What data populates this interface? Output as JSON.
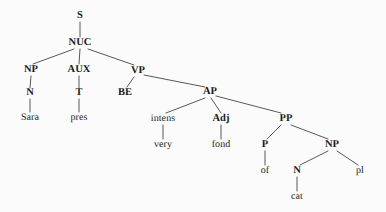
{
  "diagram": {
    "sentence": "Sara is very fond of cats",
    "background_color": "#fbfbfb",
    "line_color": "#3a3a3a",
    "text_color": "#1a1a1a"
  },
  "nodes": [
    {
      "id": "S",
      "label": "S",
      "kind": "category",
      "x": 80,
      "y": 16
    },
    {
      "id": "NUC",
      "label": "NUC",
      "kind": "category",
      "x": 80,
      "y": 43
    },
    {
      "id": "NP1",
      "label": "NP",
      "kind": "category",
      "x": 31,
      "y": 70
    },
    {
      "id": "AUX",
      "label": "AUX",
      "kind": "category",
      "x": 79,
      "y": 70
    },
    {
      "id": "VP",
      "label": "VP",
      "kind": "category",
      "x": 138,
      "y": 71
    },
    {
      "id": "N1",
      "label": "N",
      "kind": "category",
      "x": 30,
      "y": 93
    },
    {
      "id": "T",
      "label": "T",
      "kind": "category",
      "x": 79,
      "y": 93
    },
    {
      "id": "BE",
      "label": "BE",
      "kind": "category",
      "x": 125,
      "y": 93
    },
    {
      "id": "Sara",
      "label": "Sara",
      "kind": "leaf",
      "x": 30,
      "y": 118
    },
    {
      "id": "pres",
      "label": "pres",
      "kind": "leaf",
      "x": 79,
      "y": 118
    },
    {
      "id": "AP",
      "label": "AP",
      "kind": "category",
      "x": 210,
      "y": 92
    },
    {
      "id": "intens",
      "label": "intens",
      "kind": "leaf",
      "x": 163,
      "y": 119
    },
    {
      "id": "Adj",
      "label": "Adj",
      "kind": "category",
      "x": 221,
      "y": 119
    },
    {
      "id": "PP",
      "label": "PP",
      "kind": "category",
      "x": 286,
      "y": 119
    },
    {
      "id": "very",
      "label": "very",
      "kind": "leaf",
      "x": 163,
      "y": 145
    },
    {
      "id": "fond",
      "label": "fond",
      "kind": "leaf",
      "x": 221,
      "y": 145
    },
    {
      "id": "P",
      "label": "P",
      "kind": "category",
      "x": 265,
      "y": 145
    },
    {
      "id": "NP2",
      "label": "NP",
      "kind": "category",
      "x": 332,
      "y": 145
    },
    {
      "id": "of",
      "label": "of",
      "kind": "leaf",
      "x": 265,
      "y": 171
    },
    {
      "id": "N2",
      "label": "N",
      "kind": "category",
      "x": 297,
      "y": 171
    },
    {
      "id": "pl",
      "label": "pl",
      "kind": "leaf",
      "x": 360,
      "y": 171
    },
    {
      "id": "cat",
      "label": "cat",
      "kind": "leaf",
      "x": 297,
      "y": 197
    }
  ],
  "edges": [
    {
      "from": "S",
      "to": "NUC",
      "x1": 80,
      "y1": 22,
      "x2": 80,
      "y2": 37
    },
    {
      "from": "NUC",
      "to": "NP1",
      "x1": 74,
      "y1": 49,
      "x2": 33,
      "y2": 64
    },
    {
      "from": "NUC",
      "to": "AUX",
      "x1": 80,
      "y1": 49,
      "x2": 79,
      "y2": 64
    },
    {
      "from": "NUC",
      "to": "VP",
      "x1": 88,
      "y1": 49,
      "x2": 134,
      "y2": 65
    },
    {
      "from": "NP1",
      "to": "N1",
      "x1": 31,
      "y1": 76,
      "x2": 30,
      "y2": 88
    },
    {
      "from": "AUX",
      "to": "T",
      "x1": 79,
      "y1": 76,
      "x2": 79,
      "y2": 88
    },
    {
      "from": "N1",
      "to": "Sara",
      "x1": 30,
      "y1": 99,
      "x2": 30,
      "y2": 112
    },
    {
      "from": "T",
      "to": "pres",
      "x1": 79,
      "y1": 99,
      "x2": 79,
      "y2": 112
    },
    {
      "from": "VP",
      "to": "BE",
      "x1": 134,
      "y1": 77,
      "x2": 127,
      "y2": 87
    },
    {
      "from": "VP",
      "to": "AP",
      "x1": 144,
      "y1": 75,
      "x2": 205,
      "y2": 87
    },
    {
      "from": "AP",
      "to": "intens",
      "x1": 205,
      "y1": 98,
      "x2": 166,
      "y2": 113
    },
    {
      "from": "AP",
      "to": "Adj",
      "x1": 211,
      "y1": 98,
      "x2": 221,
      "y2": 113
    },
    {
      "from": "AP",
      "to": "PP",
      "x1": 216,
      "y1": 96,
      "x2": 281,
      "y2": 113
    },
    {
      "from": "intens",
      "to": "very",
      "x1": 163,
      "y1": 125,
      "x2": 163,
      "y2": 139
    },
    {
      "from": "Adj",
      "to": "fond",
      "x1": 221,
      "y1": 125,
      "x2": 221,
      "y2": 139
    },
    {
      "from": "PP",
      "to": "P",
      "x1": 281,
      "y1": 125,
      "x2": 267,
      "y2": 139
    },
    {
      "from": "PP",
      "to": "NP2",
      "x1": 291,
      "y1": 125,
      "x2": 328,
      "y2": 139
    },
    {
      "from": "P",
      "to": "of",
      "x1": 265,
      "y1": 151,
      "x2": 265,
      "y2": 165
    },
    {
      "from": "NP2",
      "to": "N2",
      "x1": 328,
      "y1": 151,
      "x2": 300,
      "y2": 165
    },
    {
      "from": "NP2",
      "to": "pl",
      "x1": 337,
      "y1": 151,
      "x2": 358,
      "y2": 165
    },
    {
      "from": "N2",
      "to": "cat",
      "x1": 297,
      "y1": 177,
      "x2": 297,
      "y2": 191
    }
  ]
}
